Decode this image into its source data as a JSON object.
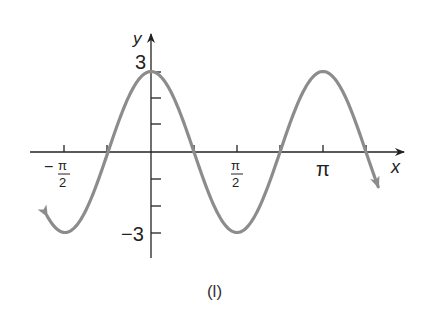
{
  "chart_data": {
    "type": "line",
    "title": "",
    "function": "y = 3cos(2x)",
    "xlabel": "x",
    "ylabel": "y",
    "x_ticks": [
      {
        "value": -1.5708,
        "label_num": "π",
        "label_den": "2",
        "sign": "−"
      },
      {
        "value": -0.7854,
        "label": ""
      },
      {
        "value": 0.7854,
        "label": ""
      },
      {
        "value": 1.5708,
        "label_num": "π",
        "label_den": "2",
        "sign": ""
      },
      {
        "value": 2.3562,
        "label": ""
      },
      {
        "value": 3.1416,
        "label": "π"
      },
      {
        "value": 3.927,
        "label": ""
      }
    ],
    "y_ticks": [
      {
        "value": 3,
        "label": "3"
      },
      {
        "value": 2,
        "label": ""
      },
      {
        "value": 1,
        "label": ""
      },
      {
        "value": -1,
        "label": ""
      },
      {
        "value": -2,
        "label": ""
      },
      {
        "value": -3,
        "label": "−3"
      }
    ],
    "xlim": [
      -1.9,
      4.15
    ],
    "ylim": [
      -3,
      3
    ],
    "grid": false,
    "legend": null,
    "series": [
      {
        "name": "y = 3cos(2x)",
        "amplitude": 3,
        "angular_frequency": 2,
        "x_start": -1.9,
        "x_end": 4.15,
        "arrows_at_ends": true,
        "key_points": [
          {
            "x": -1.5708,
            "y": -3
          },
          {
            "x": -0.7854,
            "y": 0
          },
          {
            "x": 0,
            "y": 3
          },
          {
            "x": 0.7854,
            "y": 0
          },
          {
            "x": 1.5708,
            "y": -3
          },
          {
            "x": 2.3562,
            "y": 0
          },
          {
            "x": 3.1416,
            "y": 3
          },
          {
            "x": 3.927,
            "y": 0
          }
        ],
        "color": "#8c8c8c"
      }
    ],
    "caption": "(l)"
  },
  "labels": {
    "x_axis": "x",
    "y_axis": "y",
    "y_max": "3",
    "y_min": "−3",
    "neg_half_pi_sign": "−",
    "pi_num": "π",
    "two_den": "2",
    "pi": "π",
    "caption": "(l)"
  },
  "colors": {
    "curve": "#8c8c8c",
    "axis": "#222222"
  }
}
